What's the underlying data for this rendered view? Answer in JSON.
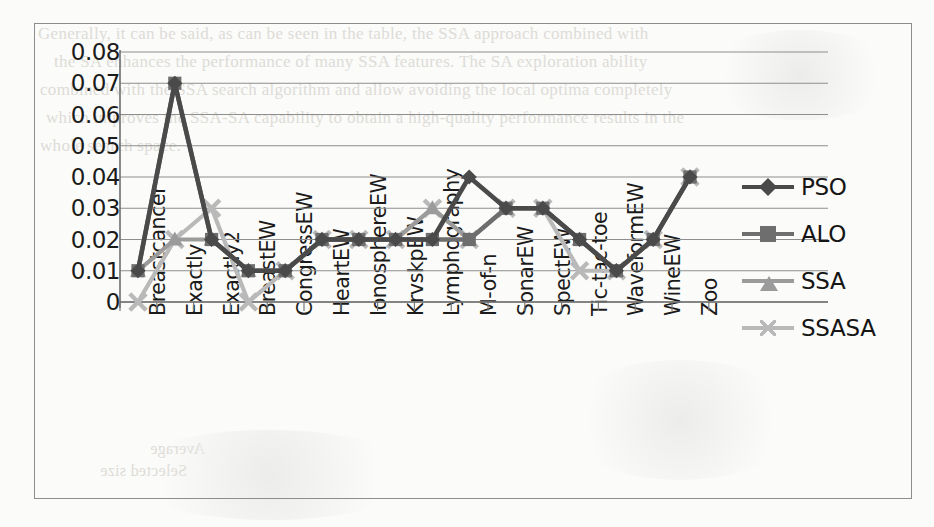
{
  "figure": {
    "kind": "scanned-line-chart",
    "frame_border_color": "#8d8d8d",
    "page_background": "#fbfbf9"
  },
  "chart_data": {
    "type": "line",
    "title": "",
    "xlabel": "",
    "ylabel": "",
    "ylim": [
      0,
      0.08
    ],
    "ytick_labels": [
      "0.08",
      "0.07",
      "0.06",
      "0.05",
      "0.04",
      "0.03",
      "0.02",
      "0.01",
      "0"
    ],
    "ytick_values": [
      0.08,
      0.07,
      0.06,
      0.05,
      0.04,
      0.03,
      0.02,
      0.01,
      0
    ],
    "grid": "horizontal",
    "legend_position": "right",
    "categories": [
      "Breastcancer",
      "Exactly",
      "Exactly2",
      "BreastEW",
      "CongressEW",
      "HeartEW",
      "IonosphereEW",
      "KrvskpEW",
      "Lymphography",
      "M-of-n",
      "SonarEW",
      "SpectEW",
      "Tic-tac-toe",
      "WaveformEW",
      "WineEW",
      "Zoo"
    ],
    "series": [
      {
        "name": "PSO",
        "marker": "diamond",
        "color": "#4a4a4a",
        "values": [
          0.01,
          0.07,
          0.02,
          0.01,
          0.01,
          0.02,
          0.02,
          0.02,
          0.02,
          0.04,
          0.03,
          0.03,
          0.02,
          0.01,
          0.02,
          0.04
        ]
      },
      {
        "name": "ALO",
        "marker": "square",
        "color": "#6e6e6e",
        "values": [
          0.01,
          0.07,
          0.02,
          0.01,
          0.01,
          0.02,
          0.02,
          0.02,
          0.02,
          0.02,
          0.03,
          0.03,
          0.02,
          0.01,
          0.02,
          0.04
        ]
      },
      {
        "name": "SSA",
        "marker": "triangle",
        "color": "#9b9b9b",
        "values": [
          0.01,
          0.02,
          0.02,
          0.01,
          0.01,
          0.02,
          0.02,
          0.02,
          0.03,
          0.02,
          0.03,
          0.03,
          0.02,
          0.01,
          0.02,
          0.04
        ]
      },
      {
        "name": "SSASA",
        "marker": "cross",
        "color": "#b9b9b9",
        "values": [
          0.0,
          0.02,
          0.03,
          0.0,
          0.01,
          0.02,
          0.02,
          0.02,
          0.03,
          0.02,
          0.03,
          0.03,
          0.01,
          0.01,
          0.02,
          0.04
        ]
      }
    ]
  },
  "legend": {
    "items": [
      {
        "label": "PSO",
        "marker": "diamond-marker",
        "color": "#4a4a4a"
      },
      {
        "label": "ALO",
        "marker": "square-marker",
        "color": "#6e6e6e"
      },
      {
        "label": "SSA",
        "marker": "triangle-marker",
        "color": "#9b9b9b"
      },
      {
        "label": "SSASA",
        "marker": "cross-marker",
        "color": "#b9b9b9"
      }
    ]
  },
  "background_text": {
    "lines": [
      "Generally, it can be said, as can be seen in the table, the SSA approach combined with",
      "the SA enhances the performance of many SSA features. The SA exploration ability",
      "combined with the SSA search algorithm and allow avoiding the local optima completely",
      "which improves the SSA-SA capability to obtain a high-quality performance results in the",
      "whole search space."
    ],
    "lower_left": [
      "Average",
      "Selected size"
    ]
  }
}
